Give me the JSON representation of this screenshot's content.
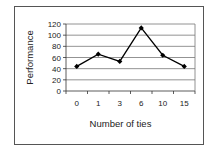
{
  "chart_data": {
    "type": "line",
    "title": "",
    "xlabel": "Number of ties",
    "ylabel": "Performance",
    "categories": [
      "0",
      "1",
      "3",
      "6",
      "10",
      "15"
    ],
    "values": [
      44,
      66,
      53,
      113,
      64,
      44
    ],
    "ylim": [
      0,
      120
    ],
    "yticks": [
      0,
      20,
      40,
      60,
      80,
      100,
      120
    ],
    "grid": true,
    "legend": null,
    "marker": "diamond",
    "line_color": "#000000"
  }
}
